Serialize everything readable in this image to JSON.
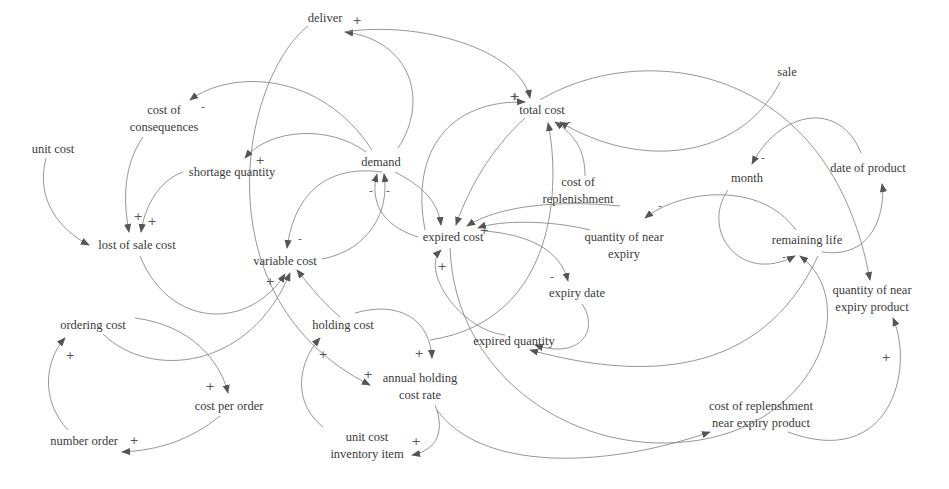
{
  "diagram": {
    "type": "causal-loop-diagram",
    "nodes": [
      {
        "id": "deliver",
        "label": "deliver",
        "x": 325,
        "y": 18
      },
      {
        "id": "total_cost",
        "label": "total cost",
        "x": 542,
        "y": 110
      },
      {
        "id": "sale",
        "label": "sale",
        "x": 787,
        "y": 72
      },
      {
        "id": "cost_of_consequences",
        "label": "cost of\nconsequences",
        "x": 164,
        "y": 119
      },
      {
        "id": "unit_cost",
        "label": "unit cost",
        "x": 53,
        "y": 149
      },
      {
        "id": "demand",
        "label": "demand",
        "x": 381,
        "y": 162
      },
      {
        "id": "shortage_quantity",
        "label": "shortage quantity",
        "x": 232,
        "y": 172
      },
      {
        "id": "month",
        "label": "month",
        "x": 747,
        "y": 178
      },
      {
        "id": "date_of_product",
        "label": "date of product",
        "x": 868,
        "y": 168
      },
      {
        "id": "cost_of_replenishment",
        "label": "cost of\nreplenishment",
        "x": 578,
        "y": 191
      },
      {
        "id": "lost_of_sale_cost",
        "label": "lost of sale cost",
        "x": 137,
        "y": 245
      },
      {
        "id": "variable_cost",
        "label": "variable cost",
        "x": 285,
        "y": 261
      },
      {
        "id": "expired_cost",
        "label": "expired cost",
        "x": 453,
        "y": 237
      },
      {
        "id": "quantity_of_near_expiry",
        "label": "quantity of near\nexpiry",
        "x": 624,
        "y": 246
      },
      {
        "id": "remaining_life",
        "label": "remaining life",
        "x": 807,
        "y": 240
      },
      {
        "id": "expiry_date",
        "label": "expiry date",
        "x": 577,
        "y": 293
      },
      {
        "id": "quantity_of_near_expiry_product",
        "label": "quantity of near\nexpiry product",
        "x": 872,
        "y": 299
      },
      {
        "id": "ordering_cost",
        "label": "ordering cost",
        "x": 93,
        "y": 325
      },
      {
        "id": "holding_cost",
        "label": "holding cost",
        "x": 343,
        "y": 325
      },
      {
        "id": "expired_quantity",
        "label": "expired quantity",
        "x": 514,
        "y": 341
      },
      {
        "id": "annual_holding_cost_rate",
        "label": "annual holding\ncost rate",
        "x": 420,
        "y": 387
      },
      {
        "id": "cost_per_order",
        "label": "cost per order",
        "x": 229,
        "y": 406
      },
      {
        "id": "cost_of_replenshment_near_expiry_product",
        "label": "cost of replenshment\nnear expiry product",
        "x": 761,
        "y": 415
      },
      {
        "id": "number_order",
        "label": "number order",
        "x": 84,
        "y": 441
      },
      {
        "id": "unit_cost_inventory_item",
        "label": "unit cost\ninventory item",
        "x": 367,
        "y": 446
      }
    ],
    "links": [
      {
        "from": "demand",
        "to": "deliver",
        "polarity": "+",
        "d": "M398,148 C430,100 410,40 345,32",
        "px": 357,
        "py": 20
      },
      {
        "from": "deliver",
        "to": "total_cost",
        "polarity": "+",
        "d": "M345,32 C420,20 520,50 530,98",
        "px": 515,
        "py": 96
      },
      {
        "from": "deliver",
        "to": "annual_holding_cost_rate",
        "polarity": "+",
        "d": "M308,26 C240,80 200,300 370,385",
        "px": 368,
        "py": 374
      },
      {
        "from": "demand",
        "to": "cost_of_consequences",
        "polarity": "-",
        "d": "M372,150 C320,70 230,70 190,100",
        "px": 203,
        "py": 106
      },
      {
        "from": "demand",
        "to": "shortage_quantity",
        "polarity": "+",
        "d": "M366,152 C330,125 270,128 245,158",
        "px": 260,
        "py": 160
      },
      {
        "from": "cost_of_consequences",
        "to": "lost_of_sale_cost",
        "polarity": "+",
        "d": "M143,137 C120,170 125,210 129,232",
        "px": 138,
        "py": 216
      },
      {
        "from": "shortage_quantity",
        "to": "lost_of_sale_cost",
        "polarity": "+",
        "d": "M183,172 C160,180 145,205 141,232",
        "px": 152,
        "py": 221
      },
      {
        "from": "unit_cost",
        "to": "lost_of_sale_cost",
        "polarity": "",
        "d": "M46,158 C35,200 60,230 89,245",
        "px": 0,
        "py": 0
      },
      {
        "from": "demand",
        "to": "variable_cost",
        "polarity": "-",
        "d": "M382,172 C330,165 295,190 287,248",
        "px": 300,
        "py": 238
      },
      {
        "from": "expired_cost",
        "to": "demand",
        "polarity": "-",
        "d": "M418,237 C380,225 370,200 377,174",
        "px": 371,
        "py": 190
      },
      {
        "from": "variable_cost",
        "to": "demand",
        "polarity": "-",
        "d": "M322,259 C370,250 390,210 384,174",
        "px": 388,
        "py": 190
      },
      {
        "from": "demand",
        "to": "expired_cost",
        "polarity": "",
        "d": "M395,172 C420,185 438,200 441,225",
        "px": 0,
        "py": 0
      },
      {
        "from": "total_cost",
        "to": "expired_cost",
        "polarity": "",
        "d": "M525,118 C490,150 468,190 456,225",
        "px": 0,
        "py": 0
      },
      {
        "from": "cost_of_replenishment",
        "to": "total_cost",
        "polarity": "-",
        "d": "M585,176 C585,150 575,135 555,122",
        "px": 569,
        "py": 121
      },
      {
        "from": "expired_quantity",
        "to": "total_cost",
        "polarity": "",
        "d": "M430,340 C560,320 560,180 548,123",
        "px": 0,
        "py": 0
      },
      {
        "from": "sale",
        "to": "total_cost",
        "polarity": "",
        "d": "M780,82 C740,160 640,170 560,122",
        "px": 0,
        "py": 0
      },
      {
        "from": "total_cost",
        "to": "quantity_of_near_expiry_product",
        "polarity": "",
        "d": "M540,100 C640,40 830,60 870,280",
        "px": 0,
        "py": 0
      },
      {
        "from": "expired_cost",
        "to": "total_cost",
        "polarity": "+",
        "d": "M425,230 C410,150 450,100 525,102",
        "px": 514,
        "py": 96
      },
      {
        "from": "cost_of_replenishment",
        "to": "expired_cost",
        "polarity": "",
        "d": "M620,206 C560,200 500,205 467,226",
        "px": 0,
        "py": 0
      },
      {
        "from": "quantity_of_near_expiry",
        "to": "expired_cost",
        "polarity": "+",
        "d": "M590,230 C550,220 500,220 478,228",
        "px": 484,
        "py": 230
      },
      {
        "from": "expired_cost",
        "to": "expiry_date",
        "polarity": "-",
        "d": "M485,231 C530,235 560,250 568,281",
        "px": 552,
        "py": 276
      },
      {
        "from": "expiry_date",
        "to": "expired_quantity",
        "polarity": "-",
        "d": "M582,304 C600,330 580,360 535,345",
        "px": 540,
        "py": 347
      },
      {
        "from": "expired_quantity",
        "to": "expired_cost",
        "polarity": "+",
        "d": "X",
        "px": 442,
        "py": 266
      },
      {
        "from": "expired_cost",
        "to": "cost_of_replenshment_near_expiry_product",
        "polarity": "",
        "d": "M450,248 C455,380 580,460 700,440 C820,420 860,300 800,256",
        "px": 0,
        "py": 0
      },
      {
        "from": "remaining_life",
        "to": "expired_quantity",
        "polarity": "",
        "d": "M818,256 C760,380 640,380 530,350",
        "px": 0,
        "py": 0
      },
      {
        "from": "remaining_life",
        "to": "quantity_of_near_expiry",
        "polarity": "-",
        "d": "M796,230 C760,180 680,190 645,218",
        "px": 660,
        "py": 205
      },
      {
        "from": "month",
        "to": "remaining_life",
        "polarity": "-",
        "d": "M728,190 C700,230 740,285 795,256",
        "px": 784,
        "py": 256
      },
      {
        "from": "remaining_life",
        "to": "date_of_product",
        "polarity": "",
        "d": "M822,252 C880,260 885,200 882,184",
        "px": 0,
        "py": 0
      },
      {
        "from": "date_of_product",
        "to": "month",
        "polarity": "-",
        "d": "M861,153 C840,100 780,110 752,164",
        "px": 763,
        "py": 157
      },
      {
        "from": "cost_of_replenshment_near_expiry_product",
        "to": "quantity_of_near_expiry_product",
        "polarity": "+",
        "d": "M788,432 C890,470 915,370 893,318",
        "px": 886,
        "py": 357
      },
      {
        "from": "holding_cost",
        "to": "variable_cost",
        "polarity": "",
        "d": "M340,317 C320,300 305,280 297,270",
        "px": 0,
        "py": 0
      },
      {
        "from": "lost_of_sale_cost",
        "to": "variable_cost",
        "polarity": "+",
        "d": "M140,256 C170,330 250,330 285,274",
        "px": 270,
        "py": 281
      },
      {
        "from": "ordering_cost",
        "to": "variable_cost",
        "polarity": "",
        "d": "M103,334 C150,380 250,370 290,273",
        "px": 0,
        "py": 0
      },
      {
        "from": "holding_cost",
        "to": "annual_holding_cost_rate",
        "polarity": "+",
        "d": "M355,313 C400,300 430,320 432,358",
        "px": 419,
        "py": 353
      },
      {
        "from": "unit_cost_inventory_item",
        "to": "holding_cost",
        "polarity": "+",
        "d": "M323,427 C290,400 300,360 320,338",
        "px": 323,
        "py": 354
      },
      {
        "from": "annual_holding_cost_rate",
        "to": "unit_cost_inventory_item",
        "polarity": "+",
        "d": "M435,405 C445,430 438,450 412,455",
        "px": 416,
        "py": 441
      },
      {
        "from": "annual_holding_cost_rate",
        "to": "cost_of_replenshment_near_expiry_product",
        "polarity": "",
        "d": "M437,410 C480,470 600,470 710,432",
        "px": 0,
        "py": 0
      },
      {
        "from": "ordering_cost",
        "to": "cost_per_order",
        "polarity": "+",
        "d": "M135,318 C190,325 220,360 228,393",
        "px": 210,
        "py": 386
      },
      {
        "from": "cost_per_order",
        "to": "number_order",
        "polarity": "+",
        "d": "M220,416 C190,440 160,450 122,452",
        "px": 134,
        "py": 440
      },
      {
        "from": "number_order",
        "to": "ordering_cost",
        "polarity": "+",
        "d": "M68,430 C40,400 45,360 65,338",
        "px": 70,
        "py": 355
      }
    ]
  }
}
